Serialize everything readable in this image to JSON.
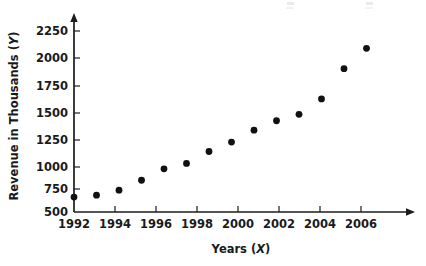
{
  "chart_data": {
    "type": "scatter",
    "title": "",
    "xlabel": "Years (X)",
    "ylabel": "Revenue in Thousands (Y)",
    "xlabel_text": "Years",
    "xlabel_var": "X",
    "ylabel_text": "Revenue in Thousands",
    "ylabel_var": "Y",
    "x": [
      1992,
      1993,
      1994,
      1995,
      1996,
      1997,
      1998,
      1999,
      2000,
      2001,
      2002,
      2003,
      2004,
      2005
    ],
    "values": [
      650,
      670,
      720,
      820,
      935,
      990,
      1110,
      1205,
      1325,
      1420,
      1485,
      1640,
      1945,
      2150
    ],
    "points": [
      {
        "x": 1992,
        "y": 650
      },
      {
        "x": 1993,
        "y": 670
      },
      {
        "x": 1994,
        "y": 720
      },
      {
        "x": 1995,
        "y": 820
      },
      {
        "x": 1996,
        "y": 935
      },
      {
        "x": 1997,
        "y": 990
      },
      {
        "x": 1998,
        "y": 1110
      },
      {
        "x": 1999,
        "y": 1205
      },
      {
        "x": 2000,
        "y": 1325
      },
      {
        "x": 2001,
        "y": 1420
      },
      {
        "x": 2002,
        "y": 1485
      },
      {
        "x": 2003,
        "y": 1640
      },
      {
        "x": 2004,
        "y": 1945
      },
      {
        "x": 2005,
        "y": 2150
      }
    ],
    "xlim": [
      1992,
      2006.8
    ],
    "ylim": [
      500,
      2375
    ],
    "xticks": [
      1992,
      1994,
      1996,
      1998,
      2000,
      2002,
      2004,
      2006
    ],
    "xtick_labels": [
      "1992",
      "1994",
      "1996",
      "1998",
      "2000",
      "2002",
      "2004",
      "2006"
    ],
    "yticks": [
      500,
      750,
      1000,
      1250,
      1500,
      1750,
      2000,
      2250
    ],
    "ytick_labels": [
      "500",
      "750",
      "1000",
      "1250",
      "1500",
      "1750",
      "2000",
      "2250"
    ],
    "grid": false,
    "legend": null,
    "marker": "filled-circle",
    "marker_color": "#111111",
    "axis_color": "#1c1c1c",
    "background": "#ffffff"
  }
}
